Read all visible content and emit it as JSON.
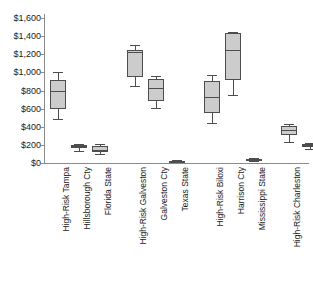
{
  "chart_data": {
    "type": "box",
    "title": "",
    "xlabel": "",
    "ylabel": "",
    "ylim": [
      0,
      1600
    ],
    "grid": false,
    "legend": "none",
    "currency_prefix": "$",
    "y_ticks": [
      {
        "value": 1600,
        "label": "$1,600"
      },
      {
        "value": 1400,
        "label": "$1,400"
      },
      {
        "value": 1200,
        "label": "$1,200"
      },
      {
        "value": 1000,
        "label": "$1,000"
      },
      {
        "value": 800,
        "label": "$800"
      },
      {
        "value": 600,
        "label": "$600"
      },
      {
        "value": 400,
        "label": "$400"
      },
      {
        "value": 200,
        "label": "$200"
      },
      {
        "value": 0,
        "label": "$0"
      }
    ],
    "categories": [
      "High-Risk Tampa",
      "Hillsborough Cty",
      "Florida State",
      "High-Risk  Galveston",
      "Galveston Cty",
      "Texas State",
      "High-Risk  Biloxi",
      "Harrison Cty",
      "Mississippi State",
      "High-Risk  Charleston",
      "Charleston Cty",
      "South Carolina State"
    ],
    "groups": [
      {
        "name": "Tampa / Florida",
        "categories": [
          "High-Risk Tampa",
          "Hillsborough Cty",
          "Florida State"
        ]
      },
      {
        "name": "Galveston / Texas",
        "categories": [
          "High-Risk  Galveston",
          "Galveston Cty",
          "Texas State"
        ]
      },
      {
        "name": "Biloxi / Mississippi",
        "categories": [
          "High-Risk  Biloxi",
          "Harrison Cty",
          "Mississippi State"
        ]
      },
      {
        "name": "Charleston / S.Carolina",
        "categories": [
          "High-Risk  Charleston",
          "Charleston Cty",
          "South Carolina State"
        ]
      }
    ],
    "boxes": [
      {
        "category": "High-Risk Tampa",
        "min": 490,
        "q1": 600,
        "median": 795,
        "q3": 920,
        "max": 1000
      },
      {
        "category": "Hillsborough Cty",
        "min": 135,
        "q1": 165,
        "median": 185,
        "q3": 200,
        "max": 215
      },
      {
        "category": "Florida State",
        "min": 95,
        "q1": 120,
        "median": 145,
        "q3": 185,
        "max": 205
      },
      {
        "category": "High-Risk  Galveston",
        "min": 845,
        "q1": 950,
        "median": 1225,
        "q3": 1250,
        "max": 1300
      },
      {
        "category": "Galveston Cty",
        "min": 605,
        "q1": 680,
        "median": 830,
        "q3": 925,
        "max": 955
      },
      {
        "category": "Texas State",
        "min": 10,
        "q1": 15,
        "median": 20,
        "q3": 25,
        "max": 30
      },
      {
        "category": "High-Risk  Biloxi",
        "min": 445,
        "q1": 555,
        "median": 730,
        "q3": 905,
        "max": 970
      },
      {
        "category": "Harrison Cty",
        "min": 755,
        "q1": 915,
        "median": 1245,
        "q3": 1435,
        "max": 1450
      },
      {
        "category": "Mississippi State",
        "min": 25,
        "q1": 35,
        "median": 40,
        "q3": 45,
        "max": 55
      },
      {
        "category": "High-Risk  Charleston",
        "min": 235,
        "q1": 310,
        "median": 360,
        "q3": 410,
        "max": 425
      },
      {
        "category": "Charleston Cty",
        "min": 150,
        "q1": 175,
        "median": 195,
        "q3": 215,
        "max": 225
      },
      {
        "category": "South Carolina State",
        "min": 70,
        "q1": 95,
        "median": 120,
        "q3": 140,
        "max": 155
      }
    ],
    "colors": {
      "box_fill": "#cccccc",
      "box_stroke": "#4d4d4d",
      "axis": "#8c8c8c",
      "text": "#1a1a1a",
      "background": "#ffffff"
    }
  }
}
